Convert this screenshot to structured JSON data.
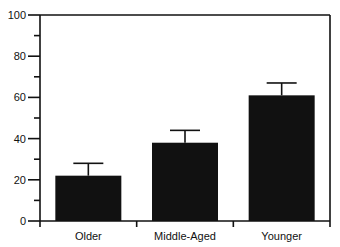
{
  "chart_data": {
    "type": "bar",
    "title": "",
    "xlabel": "",
    "ylabel": "",
    "categories": [
      "Older",
      "Middle-Aged",
      "Younger"
    ],
    "values": [
      22,
      38,
      61
    ],
    "error_bars": [
      6,
      6,
      6
    ],
    "ylim": [
      0,
      100
    ],
    "yticks": [
      0,
      20,
      40,
      60,
      80,
      100
    ],
    "ytick_labels": [
      "0",
      "20",
      "40",
      "60",
      "80",
      "100"
    ],
    "minor_yticks": [
      10,
      30,
      50,
      70,
      90
    ],
    "grid": false,
    "legend": null,
    "bar_color": "#111111"
  }
}
